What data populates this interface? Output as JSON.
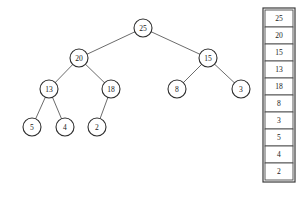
{
  "diagram": {
    "type": "binary-tree-with-array",
    "title": "",
    "tree": {
      "nodes": [
        {
          "id": "n25",
          "label": "25",
          "x": 143,
          "y": 28,
          "r": 9
        },
        {
          "id": "n20",
          "label": "20",
          "x": 79,
          "y": 58,
          "r": 9
        },
        {
          "id": "n15",
          "label": "15",
          "x": 208,
          "y": 58,
          "r": 9
        },
        {
          "id": "n13",
          "label": "13",
          "x": 49,
          "y": 89,
          "r": 9
        },
        {
          "id": "n18",
          "label": "18",
          "x": 111,
          "y": 89,
          "r": 9
        },
        {
          "id": "n8",
          "label": "8",
          "x": 177,
          "y": 89,
          "r": 9
        },
        {
          "id": "n3",
          "label": "3",
          "x": 241,
          "y": 89,
          "r": 9
        },
        {
          "id": "n5",
          "label": "5",
          "x": 32,
          "y": 127,
          "r": 9
        },
        {
          "id": "n4",
          "label": "4",
          "x": 65,
          "y": 127,
          "r": 9
        },
        {
          "id": "n2",
          "label": "2",
          "x": 97,
          "y": 127,
          "r": 9
        }
      ],
      "edges": [
        {
          "from": "n25",
          "to": "n20"
        },
        {
          "from": "n25",
          "to": "n15"
        },
        {
          "from": "n20",
          "to": "n13"
        },
        {
          "from": "n20",
          "to": "n18"
        },
        {
          "from": "n15",
          "to": "n8"
        },
        {
          "from": "n15",
          "to": "n3"
        },
        {
          "from": "n13",
          "to": "n5"
        },
        {
          "from": "n13",
          "to": "n4"
        },
        {
          "from": "n18",
          "to": "n2"
        }
      ]
    },
    "array": {
      "x": 265,
      "y": 10,
      "width": 28,
      "cell_height": 17,
      "values": [
        "25",
        "20",
        "15",
        "13",
        "18",
        "8",
        "3",
        "5",
        "4",
        "2"
      ]
    },
    "colors": {
      "node_stroke": "#2e2e2e",
      "edge_stroke": "#5a5a5a",
      "cell_stroke": "#4a4a4a",
      "text": "#1a1a1a",
      "background": "#ffffff"
    }
  }
}
